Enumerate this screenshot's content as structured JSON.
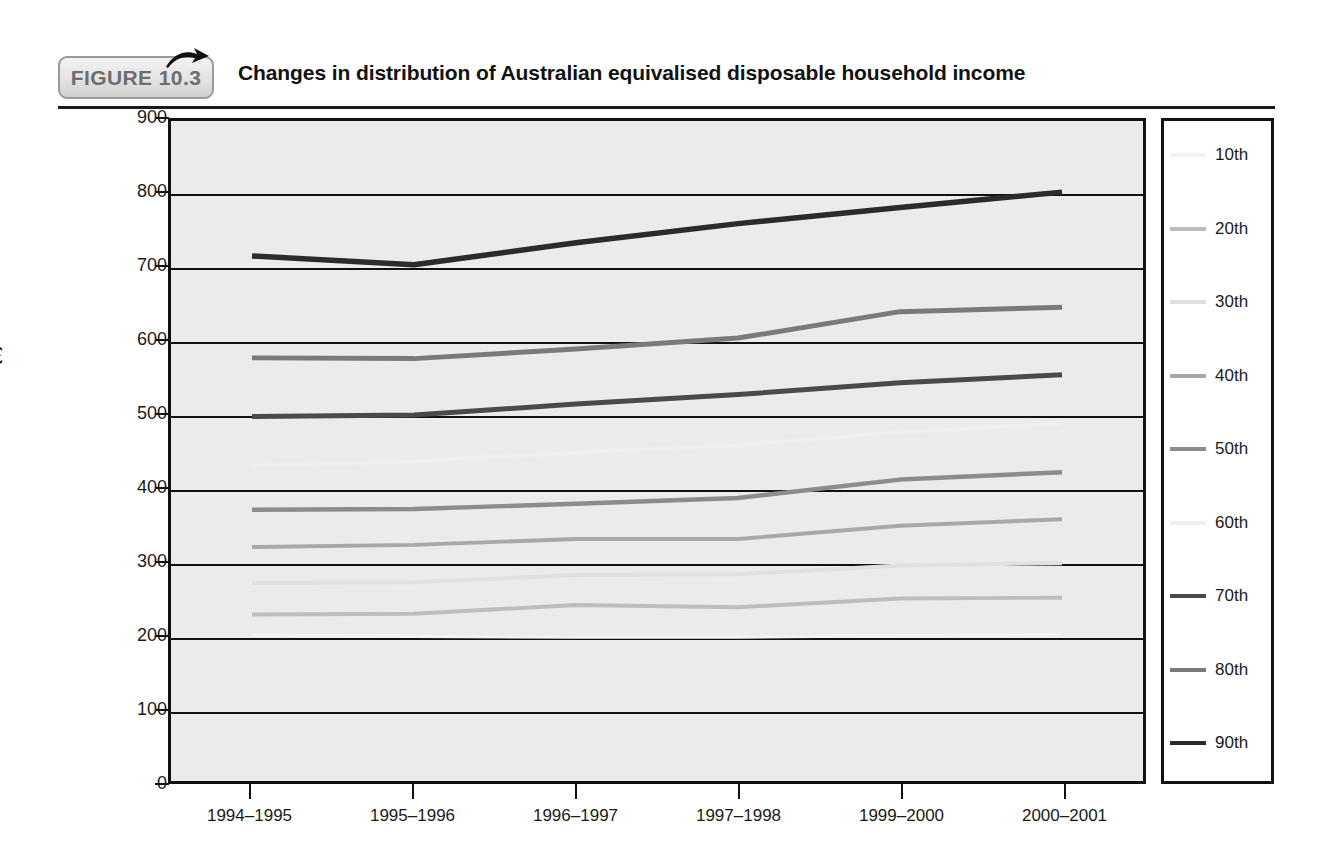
{
  "figure": {
    "badge_label": "FIGURE 10.3",
    "title": "Changes in distribution of Australian equivalised disposable household income",
    "arrow_icon": "arrow-right-icon"
  },
  "chart_data": {
    "type": "line",
    "title": "Changes in distribution of Australian equivalised disposable household income",
    "xlabel": "",
    "ylabel": "Income ($)",
    "ylim": [
      0,
      900
    ],
    "yticks": [
      0,
      100,
      200,
      300,
      400,
      500,
      600,
      700,
      800,
      900
    ],
    "ytick_labels": [
      "0",
      "100",
      "200",
      "300",
      "400",
      "500",
      "600",
      "700",
      "800",
      "900"
    ],
    "grid": true,
    "legend_position": "right",
    "categories": [
      "1994–1995",
      "1995–1996",
      "1996–1997",
      "1997–1998",
      "1999–2000",
      "2000–2001"
    ],
    "series": [
      {
        "name": "10th",
        "color": "#f2f2f2",
        "width": 3.0,
        "values": [
          199,
          197,
          196,
          196,
          198,
          200
        ]
      },
      {
        "name": "20th",
        "color": "#bdbdbd",
        "width": 4.0,
        "values": [
          227,
          228,
          240,
          237,
          249,
          250
        ]
      },
      {
        "name": "30th",
        "color": "#e0e0e0",
        "width": 4.0,
        "values": [
          270,
          271,
          281,
          282,
          294,
          297
        ]
      },
      {
        "name": "40th",
        "color": "#a8a8a8",
        "width": 4.0,
        "values": [
          319,
          322,
          330,
          330,
          348,
          357
        ]
      },
      {
        "name": "50th",
        "color": "#8c8c8c",
        "width": 4.5,
        "values": [
          370,
          371,
          378,
          386,
          411,
          421
        ]
      },
      {
        "name": "60th",
        "color": "#efefef",
        "width": 4.0,
        "values": [
          430,
          436,
          448,
          458,
          476,
          487
        ]
      },
      {
        "name": "70th",
        "color": "#4a4a4a",
        "width": 5.0,
        "values": [
          497,
          499,
          514,
          527,
          543,
          554
        ]
      },
      {
        "name": "80th",
        "color": "#7a7a7a",
        "width": 5.0,
        "values": [
          577,
          576,
          589,
          604,
          640,
          646
        ]
      },
      {
        "name": "90th",
        "color": "#2b2b2b",
        "width": 5.5,
        "values": [
          716,
          704,
          734,
          760,
          782,
          803
        ]
      }
    ]
  },
  "legend": {
    "items": [
      {
        "label": "10th",
        "color": "#f2f2f2"
      },
      {
        "label": "20th",
        "color": "#bdbdbd"
      },
      {
        "label": "30th",
        "color": "#e0e0e0"
      },
      {
        "label": "40th",
        "color": "#a8a8a8"
      },
      {
        "label": "50th",
        "color": "#8c8c8c"
      },
      {
        "label": "60th",
        "color": "#efefef"
      },
      {
        "label": "70th",
        "color": "#4a4a4a"
      },
      {
        "label": "80th",
        "color": "#7a7a7a"
      },
      {
        "label": "90th",
        "color": "#2b2b2b"
      }
    ]
  },
  "colors": {
    "plot_background": "#ebebeb",
    "frame": "#111111",
    "badge_text": "#6e6e6e",
    "page_background": "#ffffff"
  }
}
